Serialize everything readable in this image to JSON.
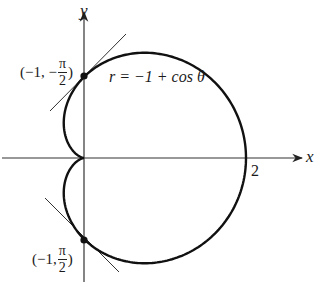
{
  "figure": {
    "type": "polar-graph",
    "equation": "r = −1 + cos θ",
    "axes": {
      "x_label": "x",
      "y_label": "y",
      "x_tick_label": "2"
    },
    "points": [
      {
        "id": "top",
        "prefix": "(−1, −",
        "frac_num": "π",
        "frac_den": "2",
        "suffix": ")"
      },
      {
        "id": "bottom",
        "prefix": "(−1, ",
        "frac_num": "π",
        "frac_den": "2",
        "suffix": ")"
      }
    ],
    "colors": {
      "curve": "#111111",
      "axis": "#333333",
      "tangent": "#333333",
      "text": "#1a1a1a"
    }
  }
}
